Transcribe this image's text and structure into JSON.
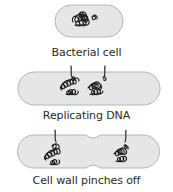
{
  "diagram": {
    "colors": {
      "cell_fill": "#e6e6e6",
      "cell_stroke": "#b5b5b5",
      "dna_stroke": "#1a1a1a",
      "label": "#2a2a2a"
    },
    "stages": [
      {
        "id": "bacterial-cell",
        "label": "Bacterial cell"
      },
      {
        "id": "replicating-dna",
        "label": "Replicating DNA"
      },
      {
        "id": "cell-wall-pinches",
        "label": "Cell wall pinches off"
      }
    ]
  }
}
